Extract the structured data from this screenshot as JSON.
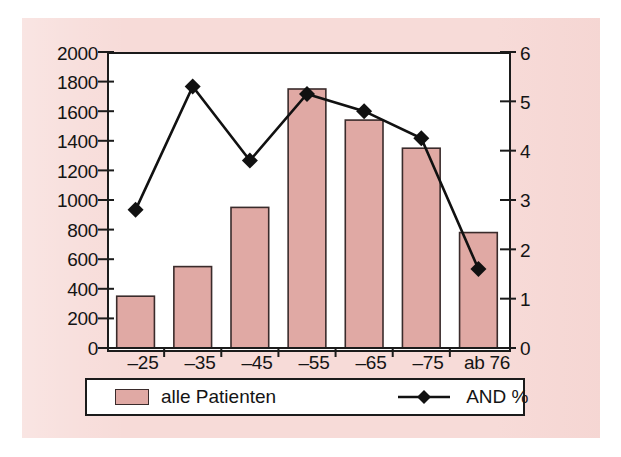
{
  "chart_data": {
    "type": "bar",
    "title": "",
    "subtitle": "",
    "xlabel": "",
    "ylabel": "",
    "categories": [
      "–25",
      "–35",
      "–45",
      "–55",
      "–65",
      "–75",
      "ab 76"
    ],
    "series": [
      {
        "name": "alle Patienten",
        "kind": "bar",
        "axis": "left",
        "values": [
          350,
          550,
          950,
          1750,
          1540,
          1350,
          780
        ]
      },
      {
        "name": "AND %",
        "kind": "line",
        "axis": "right",
        "marker": "diamond",
        "values": [
          2.8,
          5.3,
          3.8,
          5.15,
          4.8,
          4.25,
          1.6
        ]
      }
    ],
    "left_axis": {
      "min": 0,
      "max": 2000,
      "step": 200,
      "ticks": [
        "0",
        "200",
        "400",
        "600",
        "800",
        "1000",
        "1200",
        "1400",
        "1600",
        "1800",
        "2000"
      ]
    },
    "right_axis": {
      "min": 0,
      "max": 6,
      "step": 1,
      "ticks": [
        "0",
        "1",
        "2",
        "3",
        "4",
        "5",
        "6"
      ]
    },
    "grid": false,
    "legend_position": "bottom",
    "legend": [
      {
        "label": "alle Patienten",
        "marker": "bar-swatch"
      },
      {
        "label": "AND %",
        "marker": "line-diamond"
      }
    ],
    "colors": {
      "background": "#f7dbd8",
      "plot_area": "#ffffff",
      "bar_fill": "#e0a9a4",
      "bar_border": "#3a2b2b",
      "line": "#111111",
      "axis": "#1b1b1b",
      "text": "#141414"
    }
  }
}
